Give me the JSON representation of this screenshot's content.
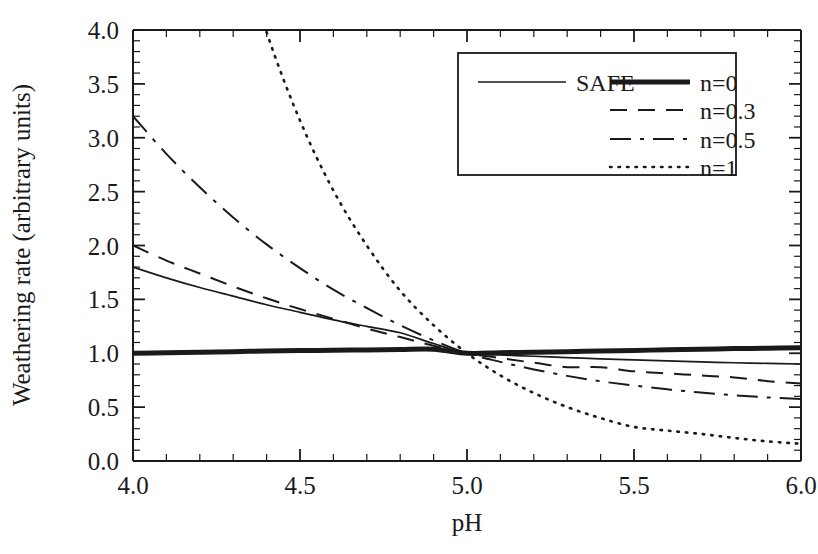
{
  "chart_data": {
    "type": "line",
    "title": "",
    "xlabel": "pH",
    "ylabel": "Weathering rate (arbitrary units)",
    "xlim": [
      4.0,
      6.0
    ],
    "ylim": [
      0.0,
      4.0
    ],
    "xticks": [
      "4.0",
      "4.5",
      "5.0",
      "5.5",
      "6.0"
    ],
    "xtick_values": [
      4.0,
      4.5,
      5.0,
      5.5,
      6.0
    ],
    "ytick_values": [
      0.0,
      0.5,
      1.0,
      1.5,
      2.0,
      2.5,
      3.0,
      3.5,
      4.0
    ],
    "yticks": [
      "0.0",
      "0.5",
      "1.0",
      "1.5",
      "2.0",
      "2.5",
      "3.0",
      "3.5",
      "4.0"
    ],
    "x_minor_step": 0.1,
    "y_minor_step": 0.1,
    "grid": false,
    "legend_position": "top-right",
    "crossover_point": {
      "x": 5.0,
      "y": 1.0
    },
    "x": [
      4.0,
      4.1,
      4.2,
      4.3,
      4.4,
      4.5,
      4.6,
      4.7,
      4.8,
      4.9,
      5.0,
      5.1,
      5.2,
      5.3,
      5.4,
      5.5,
      5.6,
      5.7,
      5.8,
      5.9,
      6.0
    ],
    "series": [
      {
        "name": "SAFE",
        "style": "solid-thin",
        "values": [
          1.8,
          1.7,
          1.61,
          1.53,
          1.45,
          1.38,
          1.31,
          1.25,
          1.19,
          1.09,
          1.0,
          0.985,
          0.972,
          0.959,
          0.948,
          0.938,
          0.929,
          0.92,
          0.912,
          0.906,
          0.9
        ]
      },
      {
        "name": "n=0",
        "style": "solid-thick",
        "values": [
          1.0,
          1.005,
          1.01,
          1.015,
          1.02,
          1.025,
          1.028,
          1.031,
          1.034,
          1.037,
          1.0,
          1.005,
          1.01,
          1.015,
          1.02,
          1.026,
          1.032,
          1.038,
          1.043,
          1.047,
          1.05
        ]
      },
      {
        "name": "n=0.3",
        "style": "dashed",
        "values": [
          2.0,
          1.86,
          1.74,
          1.62,
          1.51,
          1.41,
          1.32,
          1.23,
          1.15,
          1.07,
          1.0,
          0.955,
          0.912,
          0.871,
          0.871,
          0.832,
          0.813,
          0.794,
          0.776,
          0.741,
          0.72
        ]
      },
      {
        "name": "n=0.5",
        "style": "dash-dot",
        "values": [
          3.2,
          2.85,
          2.54,
          2.26,
          2.01,
          1.79,
          1.59,
          1.42,
          1.26,
          1.12,
          1.0,
          0.92,
          0.85,
          0.79,
          0.74,
          0.7,
          0.665,
          0.635,
          0.61,
          0.59,
          0.575
        ]
      },
      {
        "name": "n=1",
        "style": "dotted",
        "values": [
          10.0,
          7.94,
          6.31,
          5.01,
          3.98,
          3.16,
          2.51,
          2.0,
          1.58,
          1.26,
          1.0,
          0.794,
          0.631,
          0.501,
          0.398,
          0.316,
          0.282,
          0.251,
          0.214,
          0.182,
          0.16
        ]
      }
    ],
    "legend": [
      {
        "label": "SAFE",
        "style": "solid-thin"
      },
      {
        "label": "n=0",
        "style": "solid-thick"
      },
      {
        "label": "n=0.3",
        "style": "dashed"
      },
      {
        "label": "n=0.5",
        "style": "dash-dot"
      },
      {
        "label": "n=1",
        "style": "dotted"
      }
    ],
    "colors": {
      "line": "#1a1a1a",
      "axis": "#1a1a1a",
      "background": "#ffffff"
    }
  }
}
